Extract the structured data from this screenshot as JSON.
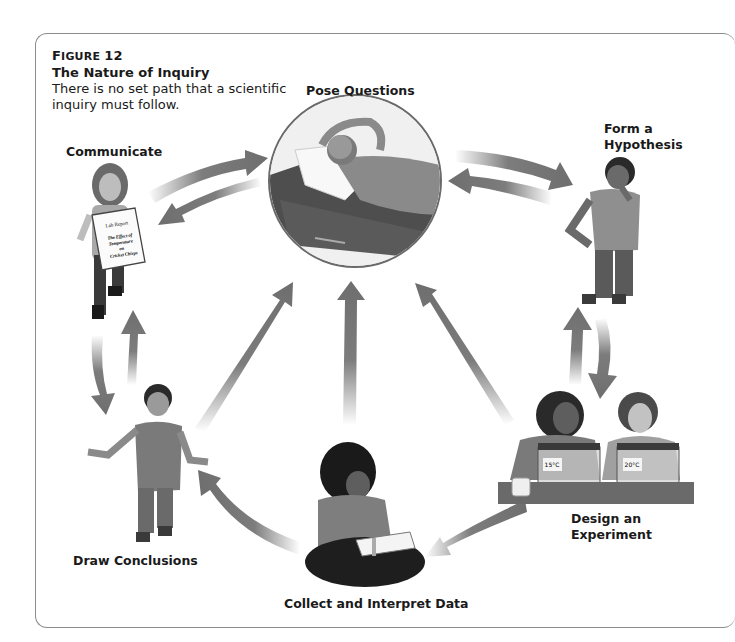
{
  "figure": {
    "number_prefix": "Figure",
    "number": "12",
    "title": "The Nature of Inquiry",
    "description": "There is no set path that a scientific inquiry must follow."
  },
  "stages": [
    {
      "id": "pose-questions",
      "label": "Pose Questions",
      "image": "student lying on cot thinking, arms behind head (circular photo)"
    },
    {
      "id": "form-hypothesis",
      "label_line1": "Form a",
      "label_line2": "Hypothesis",
      "image": "student standing, hand on chin"
    },
    {
      "id": "design-experiment",
      "label_line1": "Design an",
      "label_line2": "Experiment",
      "image": "two students with terrariums labeled temperatures"
    },
    {
      "id": "collect-data",
      "label": "Collect and Interpret Data",
      "image": "student sitting cross-legged writing on clipboard"
    },
    {
      "id": "draw-conclusions",
      "label": "Draw Conclusions",
      "image": "student shrugging with open hands"
    },
    {
      "id": "communicate",
      "label": "Communicate",
      "image": "student holding a lab report"
    }
  ],
  "lab_report": {
    "heading": "Lab Report",
    "title_lines": [
      "The Effect of",
      "Temperature",
      "on",
      "Cricket Chirps"
    ]
  },
  "terrarium_labels": [
    "15°C",
    "20°C"
  ],
  "arrows": [
    {
      "from": "communicate",
      "to": "pose-questions"
    },
    {
      "from": "pose-questions",
      "to": "communicate"
    },
    {
      "from": "pose-questions",
      "to": "form-hypothesis"
    },
    {
      "from": "form-hypothesis",
      "to": "pose-questions"
    },
    {
      "from": "form-hypothesis",
      "to": "design-experiment"
    },
    {
      "from": "design-experiment",
      "to": "form-hypothesis"
    },
    {
      "from": "communicate",
      "to": "draw-conclusions"
    },
    {
      "from": "draw-conclusions",
      "to": "communicate"
    },
    {
      "from": "draw-conclusions",
      "to": "pose-questions"
    },
    {
      "from": "collect-data",
      "to": "pose-questions"
    },
    {
      "from": "design-experiment",
      "to": "pose-questions"
    },
    {
      "from": "collect-data",
      "to": "draw-conclusions"
    },
    {
      "from": "design-experiment",
      "to": "collect-data"
    }
  ],
  "colors": {
    "arrow": "#6e6e6e",
    "frame": "#8c8c8c",
    "text": "#1a1a1a"
  }
}
